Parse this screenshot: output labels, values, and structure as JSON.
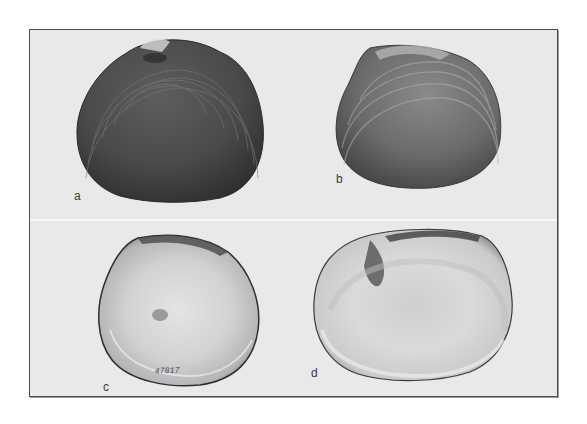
{
  "figure": {
    "panels": [
      {
        "id": "a",
        "label": "a",
        "view": "exterior",
        "tone": "dark"
      },
      {
        "id": "b",
        "label": "b",
        "view": "exterior",
        "tone": "medium"
      },
      {
        "id": "c",
        "label": "c",
        "view": "interior",
        "tone": "light",
        "specimen_number": "47817"
      },
      {
        "id": "d",
        "label": "d",
        "view": "interior",
        "tone": "light"
      }
    ]
  },
  "colors": {
    "page_background": "#ffffff",
    "plate_background": "#e9e9e9",
    "frame": "#4d4d4d"
  }
}
